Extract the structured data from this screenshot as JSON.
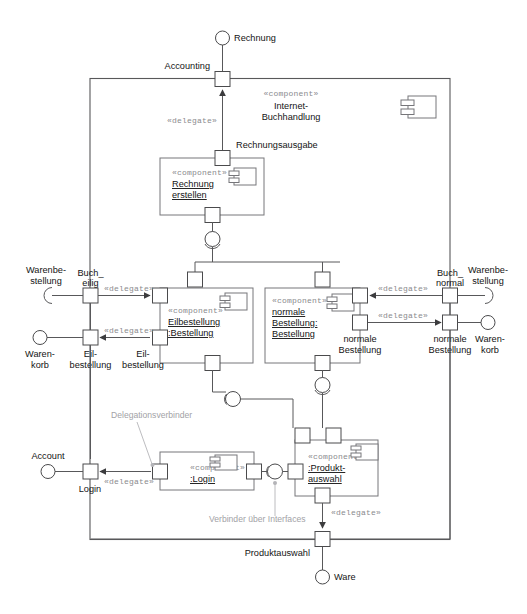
{
  "diagram": {
    "type": "uml-component-diagram",
    "language": "de",
    "outer_component": {
      "stereotype": "«component»",
      "name_line1": "Internet-",
      "name_line2": "Buchhandlung"
    },
    "components": [
      {
        "id": "rechnung-erstellen",
        "stereotype": "«component»",
        "name_line1": "Rechnung ",
        "name_line2": "erstellen"
      },
      {
        "id": "eilbestellung",
        "stereotype": "«component»",
        "name_line1": "Eilbestellung",
        "name_line2": ":Bestellung"
      },
      {
        "id": "normale-bestellung",
        "stereotype": "«component»",
        "name_line1": "normale ",
        "name_line2": "Bestellung:",
        "name_line3": "Bestellung"
      },
      {
        "id": "login",
        "stereotype": "«component»",
        "name_line1": ":Login"
      },
      {
        "id": "produktauswahl",
        "stereotype": "«component»",
        "name_line1": ":Produkt-",
        "name_line2": "auswahl"
      }
    ],
    "interfaces": [
      {
        "id": "rechnung",
        "label": "Rechnung",
        "kind": "provided"
      },
      {
        "id": "warenbestellung-links",
        "label_line1": "Warenbe-",
        "label_line2": "stellung",
        "kind": "required"
      },
      {
        "id": "warenkorb-links",
        "label_line1": "Waren-",
        "label_line2": "korb",
        "kind": "provided"
      },
      {
        "id": "warenbestellung-rechts",
        "label_line1": "Warenbe-",
        "label_line2": "stellung",
        "kind": "required"
      },
      {
        "id": "warenkorb-rechts",
        "label_line1": "Waren-",
        "label_line2": "korb",
        "kind": "provided"
      },
      {
        "id": "account",
        "label": "Account",
        "kind": "provided"
      },
      {
        "id": "ware",
        "label": "Ware",
        "kind": "provided"
      }
    ],
    "ports": [
      {
        "id": "accounting",
        "label": "Accounting"
      },
      {
        "id": "rechnungsausgabe",
        "label": "Rechnungsausgabe"
      },
      {
        "id": "buch-eilig",
        "label_line1": "Buch_",
        "label_line2": "eilig"
      },
      {
        "id": "eilbestellung-aussen",
        "label_line1": "Eil-",
        "label_line2": "bestellung"
      },
      {
        "id": "eilbestellung-innen",
        "label_line1": "Eil-",
        "label_line2": "bestellung"
      },
      {
        "id": "buch-normal",
        "label_line1": "Buch_",
        "label_line2": "normal"
      },
      {
        "id": "normale-bestellung-aussen",
        "label_line1": "normale",
        "label_line2": "Bestellung"
      },
      {
        "id": "normale-bestellung-innen",
        "label_line1": "normale",
        "label_line2": "Bestellung"
      },
      {
        "id": "login-aussen",
        "label": "Login"
      },
      {
        "id": "produktauswahl-unten",
        "label": "Produktauswahl"
      }
    ],
    "delegate_labels": [
      {
        "id": "delegate-accounting",
        "text": "«delegate»"
      },
      {
        "id": "delegate-buch-eilig",
        "text": "«delegate»"
      },
      {
        "id": "delegate-eilbestellung",
        "text": "«delegate»"
      },
      {
        "id": "delegate-buch-normal",
        "text": "«delegate»"
      },
      {
        "id": "delegate-normale-bestellung",
        "text": "«delegate»"
      },
      {
        "id": "delegate-login",
        "text": "«delegate»"
      },
      {
        "id": "delegate-produktauswahl",
        "text": "«delegate»"
      }
    ],
    "annotations": [
      {
        "id": "delegationsverbinder",
        "text": "Delegationsverbinder"
      },
      {
        "id": "verbinder-ueber-interfaces",
        "text": "Verbinder über Interfaces"
      }
    ],
    "colors": {
      "line": "#58585a",
      "component_border": "#76767a",
      "annotation": "#a2a2a6",
      "stereotype": "#8a8a8e",
      "text": "#141414",
      "background": "#ffffff"
    }
  }
}
